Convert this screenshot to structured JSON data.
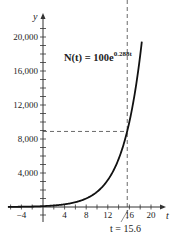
{
  "chart_data": {
    "type": "line",
    "title": "",
    "function_label": "N(t) = 100e^{0.288t}",
    "formula": {
      "lhs": "N(t) = 100e",
      "exponent": "0.288t"
    },
    "xlabel": "t",
    "ylabel": "y",
    "xlim": [
      -6,
      21
    ],
    "ylim": [
      -1500,
      22000
    ],
    "x_ticks": [
      -4,
      4,
      8,
      12,
      16,
      20
    ],
    "x_tick_labels": [
      "−4",
      "4",
      "8",
      "12",
      "16",
      "20"
    ],
    "y_ticks": [
      4000,
      8000,
      12000,
      16000,
      20000
    ],
    "y_tick_labels": [
      "4,000",
      "8,000",
      "12,000",
      "16,000",
      "20,000"
    ],
    "series": [
      {
        "name": "N(t) = 100e^{0.288t}",
        "x": [
          -6,
          -4,
          0,
          4,
          8,
          10,
          12,
          14,
          15.6,
          16,
          17,
          18.3
        ],
        "values": [
          17.8,
          31.6,
          100,
          316.5,
          1002,
          1777,
          3171,
          5641,
          8889,
          10025,
          13378,
          19480
        ]
      }
    ],
    "annotations": [
      {
        "type": "dashed-hline",
        "y": 8889,
        "x_from": 0,
        "x_to": 15.6
      },
      {
        "type": "dashed-vline",
        "x": 15.6,
        "y_from": -1200,
        "y_to": 8889
      },
      {
        "type": "text",
        "text": "t = 15.6",
        "x": 15.6,
        "y": -1500
      }
    ],
    "grid": false,
    "legend": "none"
  },
  "labels": {
    "y_axis": "y",
    "x_axis": "t",
    "annotation": "t = 15.6",
    "formula_main": "N(t) = 100e",
    "formula_exp": "0.288t"
  }
}
